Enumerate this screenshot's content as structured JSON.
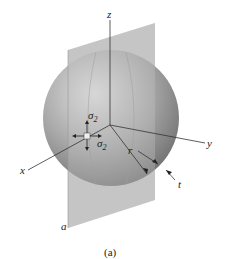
{
  "figure": {
    "caption": "(a)",
    "labels": {
      "z_axis": "z",
      "y_axis": "y",
      "x_axis": "x",
      "radius": "r",
      "thickness": "t",
      "plane": "a",
      "sigma_top": "σ",
      "sigma_top_sub": "2",
      "sigma_right": "σ",
      "sigma_right_sub": "2"
    },
    "colors": {
      "sphere_light": "#d6d6d6",
      "sphere_dark": "#7a7a7a",
      "plane": "#b8b8b8",
      "axis": "#333333"
    }
  }
}
